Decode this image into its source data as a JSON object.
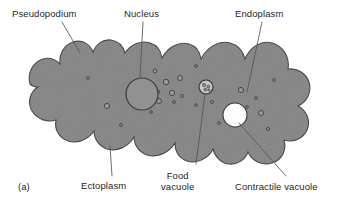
{
  "figure": {
    "panel_tag": "(a)",
    "background_color": "#ffffff",
    "body_fill_color": "#8d8d8d",
    "body_stroke_color": "#4a4a4a",
    "nucleus_fill_color": "#8f8f8f",
    "vacuole_fill_color": "#fdfdfd",
    "granule_stroke_color": "#3c3c3c",
    "leader_line_color": "#55555a",
    "text_color": "#262626"
  },
  "labels": [
    {
      "id": "pseudopodium",
      "text": "Pseudopodium",
      "x": 12,
      "y": 8,
      "align": "left"
    },
    {
      "id": "nucleus",
      "text": "Nucleus",
      "x": 124,
      "y": 8,
      "align": "left"
    },
    {
      "id": "endoplasm",
      "text": "Endoplasm",
      "x": 235,
      "y": 8,
      "align": "left"
    },
    {
      "id": "ectoplasm",
      "text": "Ectoplasm",
      "x": 81,
      "y": 180,
      "align": "left"
    },
    {
      "id": "food-vacuole",
      "text": "Food\nvacuole",
      "x": 161,
      "y": 170,
      "align": "left"
    },
    {
      "id": "contractile-vacuole",
      "text": "Contractile vacuole",
      "x": 235,
      "y": 181,
      "align": "left"
    }
  ],
  "structures": {
    "nucleus": {
      "cx": 142,
      "cy": 94,
      "r": 16
    },
    "food_vacuole": {
      "cx": 206,
      "cy": 87,
      "r": 7
    },
    "contractile_vacuole": {
      "cx": 235,
      "cy": 115,
      "r": 12
    },
    "granule_count": 22
  },
  "leader_lines": [
    {
      "id": "pseudopodium-leader",
      "from": [
        62,
        22
      ],
      "to": [
        80,
        53
      ]
    },
    {
      "id": "nucleus-leader",
      "from": [
        143,
        22
      ],
      "to": [
        140,
        78
      ]
    },
    {
      "id": "endoplasm-leader",
      "from": [
        262,
        22
      ],
      "to": [
        247,
        92
      ]
    },
    {
      "id": "ectoplasm-leader",
      "from": [
        112,
        176
      ],
      "to": [
        110,
        146
      ]
    },
    {
      "id": "food-vacuole-leader",
      "from": [
        196,
        164
      ],
      "to": [
        205,
        94
      ]
    },
    {
      "id": "contractile-vacuole-leader",
      "from": [
        286,
        176
      ],
      "to": [
        239,
        123
      ]
    }
  ]
}
